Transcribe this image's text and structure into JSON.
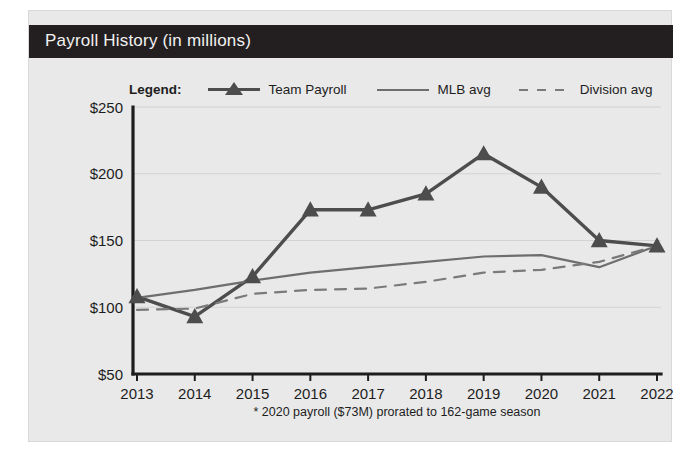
{
  "card": {
    "title": "Payroll History (in millions)"
  },
  "legend": {
    "label": "Legend:",
    "entries": [
      {
        "name": "Team Payroll",
        "marker": "triangle-line",
        "color": "#4d4d4d"
      },
      {
        "name": "MLB avg",
        "marker": "solid-line",
        "color": "#6e6e6e"
      },
      {
        "name": "Division avg",
        "marker": "dashed-line",
        "color": "#7a7a7a"
      }
    ]
  },
  "footnote": "* 2020 payroll ($73M) prorated to 162-game season",
  "colors": {
    "card_background": "#e9e9e9",
    "header_band": "#231f20",
    "title_text": "#f2f2f2",
    "axis": "#1d1d1d",
    "gridline": "#d2d2d2",
    "team_payroll": "#4d4d4d",
    "mlb_avg": "#6e6e6e",
    "division_avg": "#7a7a7a"
  },
  "chart_data": {
    "type": "line",
    "title": "Payroll History (in millions)",
    "xlabel": "",
    "ylabel": "",
    "x": [
      2013,
      2014,
      2015,
      2016,
      2017,
      2018,
      2019,
      2020,
      2021,
      2022
    ],
    "categories": [
      "2013",
      "2014",
      "2015",
      "2016",
      "2017",
      "2018",
      "2019",
      "2020",
      "2021",
      "2022"
    ],
    "ylim": [
      50,
      250
    ],
    "yticks": [
      50,
      100,
      150,
      200,
      250
    ],
    "ytick_labels": [
      "$50",
      "$100",
      "$150",
      "$200",
      "$250"
    ],
    "grid": true,
    "legend_position": "above-plot",
    "annotations": [
      "* 2020 payroll ($73M) prorated to 162-game season"
    ],
    "series": [
      {
        "name": "Team Payroll",
        "marker": "triangle",
        "style": "solid",
        "color": "#4d4d4d",
        "values": [
          108,
          93,
          123,
          173,
          173,
          185,
          215,
          190,
          150,
          146
        ]
      },
      {
        "name": "MLB avg",
        "marker": "none",
        "style": "solid",
        "color": "#6e6e6e",
        "values": [
          107,
          113,
          120,
          126,
          130,
          134,
          138,
          139,
          130,
          146
        ]
      },
      {
        "name": "Division avg",
        "marker": "none",
        "style": "dashed",
        "color": "#7a7a7a",
        "values": [
          98,
          99,
          110,
          113,
          114,
          119,
          126,
          128,
          134,
          146
        ]
      }
    ]
  }
}
